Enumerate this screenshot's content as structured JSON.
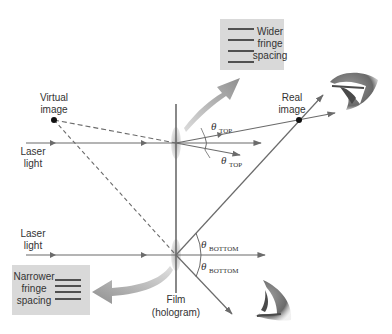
{
  "labels": {
    "virtual_image": [
      "Virtual",
      "image"
    ],
    "real_image": [
      "Real",
      "image"
    ],
    "laser_top": [
      "Laser",
      "light"
    ],
    "laser_bottom": [
      "Laser",
      "light"
    ],
    "film": [
      "Film",
      "(hologram)"
    ],
    "wider_box": [
      "Wider",
      "fringe",
      "spacing"
    ],
    "narrower_box": [
      "Narrower",
      "fringe",
      "spacing"
    ],
    "theta_symbol": "θ",
    "theta_top_sub": "TOP",
    "theta_bottom_sub": "BOTTOM"
  },
  "colors": {
    "line": "#6b6b6b",
    "dashed": "#6b6b6b",
    "box_fill": "#d9d9d9",
    "curved_arrow": "#9a9a9a",
    "lens_blob": "#bdbdbd",
    "dot": "#111111",
    "eye_dark": "#4a4a4a",
    "eye_mid": "#8c8c8c"
  }
}
